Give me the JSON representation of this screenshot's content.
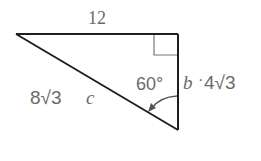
{
  "diagram": {
    "type": "right-triangle",
    "colors": {
      "line": "#1e1e1e",
      "marker": "#777777",
      "text": "#6a6a6a"
    },
    "vertices": {
      "left": [
        16,
        34
      ],
      "right_angle": [
        178,
        34
      ],
      "bottom": [
        178,
        130
      ]
    },
    "labels": {
      "top_side": "12",
      "hypotenuse_value": "8√3",
      "hypotenuse_var": "c",
      "right_side_var": "b",
      "right_side_value": "4√3",
      "right_side_dot": "·",
      "angle": "60°"
    },
    "sides": {
      "top": {
        "length_label": "12"
      },
      "hypotenuse": {
        "name": "c",
        "value": "8√3"
      },
      "vertical": {
        "name": "b",
        "value": "4√3"
      }
    },
    "angle_marker": {
      "vertex": "bottom",
      "degrees": 60
    },
    "right_angle_marker": {
      "vertex": "top-right",
      "size": 24
    }
  }
}
